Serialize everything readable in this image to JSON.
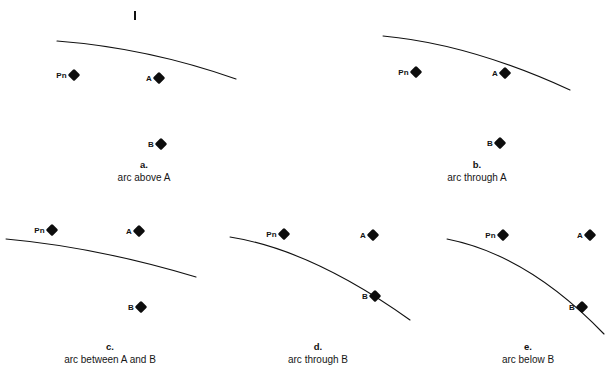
{
  "figure": {
    "width": 609,
    "height": 384,
    "background_color": "#ffffff",
    "line_color": "#111111",
    "marker_color": "#0d0d0d",
    "top_tick_label": "I"
  },
  "panels": [
    {
      "id": "a",
      "caption_letter": "a.",
      "caption_text": "arc above A",
      "caption_x": 144,
      "caption_y": 158,
      "arc": "M 57 41 Q 148 48 236 79",
      "markers": [
        {
          "name": "Pn",
          "label": "Pn",
          "x": 74,
          "y": 75,
          "label_dx": -7
        },
        {
          "name": "A",
          "label": "A",
          "x": 159,
          "y": 78,
          "label_dx": -7
        },
        {
          "name": "B",
          "label": "B",
          "x": 161,
          "y": 144,
          "label_dx": -7
        }
      ],
      "tick": {
        "x": 134,
        "y": 11
      }
    },
    {
      "id": "b",
      "caption_letter": "b.",
      "caption_text": "arc through A",
      "caption_x": 477,
      "caption_y": 158,
      "arc": "M 383 36 Q 470 44 570 90",
      "markers": [
        {
          "name": "Pn",
          "label": "Pn",
          "x": 416,
          "y": 72,
          "label_dx": -7
        },
        {
          "name": "A",
          "label": "A",
          "x": 505,
          "y": 73,
          "label_dx": -7
        },
        {
          "name": "B",
          "label": "B",
          "x": 500,
          "y": 143,
          "label_dx": -7
        }
      ],
      "tick": null
    },
    {
      "id": "c",
      "caption_letter": "c.",
      "caption_text": "arc between A and B",
      "caption_x": 110,
      "caption_y": 340,
      "arc": "M 6 239 Q 96 247 196 277",
      "markers": [
        {
          "name": "Pn",
          "label": "Pn",
          "x": 52,
          "y": 230,
          "label_dx": -7
        },
        {
          "name": "A",
          "label": "A",
          "x": 139,
          "y": 231,
          "label_dx": -7
        },
        {
          "name": "B",
          "label": "B",
          "x": 141,
          "y": 307,
          "label_dx": -7
        }
      ],
      "tick": null
    },
    {
      "id": "d",
      "caption_letter": "d.",
      "caption_text": "arc through B",
      "caption_x": 318,
      "caption_y": 340,
      "arc": "M 230 237 Q 312 250 410 320",
      "markers": [
        {
          "name": "Pn",
          "label": "Pn",
          "x": 284,
          "y": 234,
          "label_dx": -7
        },
        {
          "name": "A",
          "label": "A",
          "x": 373,
          "y": 235,
          "label_dx": -7
        },
        {
          "name": "B",
          "label": "B",
          "x": 375,
          "y": 296,
          "label_dx": -7
        }
      ],
      "tick": null
    },
    {
      "id": "e",
      "caption_letter": "e.",
      "caption_text": "arc below B",
      "caption_x": 528,
      "caption_y": 340,
      "arc": "M 447 239 Q 528 255 604 334",
      "markers": [
        {
          "name": "Pn",
          "label": "Pn",
          "x": 503,
          "y": 235,
          "label_dx": -7
        },
        {
          "name": "A",
          "label": "A",
          "x": 590,
          "y": 235,
          "label_dx": -7
        },
        {
          "name": "B",
          "label": "B",
          "x": 582,
          "y": 307,
          "label_dx": -7
        }
      ],
      "tick": null
    }
  ]
}
